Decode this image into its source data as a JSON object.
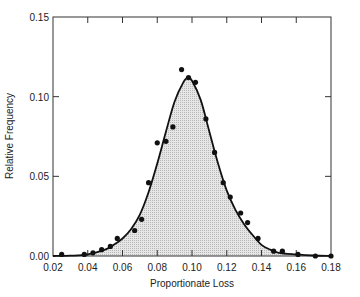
{
  "chart_data": {
    "type": "scatter",
    "title": "",
    "xlabel": "Proportionate Loss",
    "ylabel": "Relative Frequency",
    "xlim": [
      0.02,
      0.18
    ],
    "ylim": [
      0.0,
      0.15
    ],
    "xticks": [
      "0.02",
      "0.04",
      "0.06",
      "0.08",
      "0.10",
      "0.12",
      "0.14",
      "0.16",
      "0.18"
    ],
    "yticks": [
      "0.00",
      "0.05",
      "0.10",
      "0.15"
    ],
    "grid": false,
    "legend": null,
    "series": [
      {
        "name": "observed",
        "kind": "scatter",
        "points": [
          [
            0.025,
            0.001
          ],
          [
            0.038,
            0.001
          ],
          [
            0.043,
            0.002
          ],
          [
            0.048,
            0.004
          ],
          [
            0.053,
            0.006
          ],
          [
            0.057,
            0.011
          ],
          [
            0.067,
            0.016
          ],
          [
            0.071,
            0.023
          ],
          [
            0.075,
            0.046
          ],
          [
            0.08,
            0.071
          ],
          [
            0.085,
            0.072
          ],
          [
            0.089,
            0.081
          ],
          [
            0.094,
            0.117
          ],
          [
            0.098,
            0.112
          ],
          [
            0.102,
            0.109
          ],
          [
            0.108,
            0.086
          ],
          [
            0.113,
            0.065
          ],
          [
            0.118,
            0.046
          ],
          [
            0.122,
            0.037
          ],
          [
            0.128,
            0.027
          ],
          [
            0.132,
            0.021
          ],
          [
            0.138,
            0.011
          ],
          [
            0.147,
            0.003
          ],
          [
            0.152,
            0.003
          ],
          [
            0.161,
            0.001
          ],
          [
            0.171,
            0.0
          ],
          [
            0.18,
            0.0
          ]
        ]
      },
      {
        "name": "fitted density",
        "kind": "line-filled",
        "points": [
          [
            0.02,
            0.0
          ],
          [
            0.03,
            0.0002
          ],
          [
            0.04,
            0.001
          ],
          [
            0.05,
            0.004
          ],
          [
            0.055,
            0.007
          ],
          [
            0.06,
            0.011
          ],
          [
            0.065,
            0.017
          ],
          [
            0.07,
            0.026
          ],
          [
            0.075,
            0.04
          ],
          [
            0.08,
            0.058
          ],
          [
            0.085,
            0.078
          ],
          [
            0.09,
            0.097
          ],
          [
            0.095,
            0.109
          ],
          [
            0.0977,
            0.112
          ],
          [
            0.1,
            0.11
          ],
          [
            0.105,
            0.098
          ],
          [
            0.11,
            0.078
          ],
          [
            0.115,
            0.058
          ],
          [
            0.12,
            0.041
          ],
          [
            0.125,
            0.029
          ],
          [
            0.13,
            0.02
          ],
          [
            0.135,
            0.013
          ],
          [
            0.14,
            0.007
          ],
          [
            0.145,
            0.004
          ],
          [
            0.15,
            0.002
          ],
          [
            0.16,
            0.001
          ],
          [
            0.17,
            0.0003
          ],
          [
            0.18,
            0.0
          ]
        ]
      }
    ]
  }
}
